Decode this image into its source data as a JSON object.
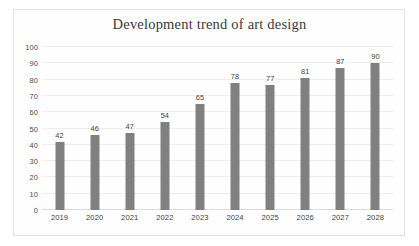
{
  "chart_data": {
    "type": "bar",
    "title": "Development trend of art design",
    "categories": [
      "2019",
      "2020",
      "2021",
      "2022",
      "2023",
      "2024",
      "2025",
      "2026",
      "2027",
      "2028"
    ],
    "values": [
      42,
      46,
      47,
      54,
      65,
      78,
      77,
      81,
      87,
      90
    ],
    "xlabel": "",
    "ylabel": "",
    "ylim": [
      0,
      100
    ],
    "y_ticks": [
      0,
      10,
      20,
      30,
      40,
      50,
      60,
      70,
      80,
      90,
      100
    ],
    "y_tick_labels": [
      "0",
      "10",
      "20",
      "30",
      "40",
      "50",
      "60",
      "70",
      "80",
      "90",
      "100"
    ],
    "grid": true,
    "legend": false,
    "data_labels": true,
    "series": [
      {
        "name": "Development trend of art design",
        "values": [
          42,
          46,
          47,
          54,
          65,
          78,
          77,
          81,
          87,
          90
        ]
      }
    ],
    "colors": {
      "bar": "#808080",
      "gridline": "#ededed",
      "baseline": "#dcdcdc",
      "frame_border": "#e3e3e3",
      "background": "#ffffff",
      "title_text": "#3a3a3a",
      "tick_text": "#3f3f3f"
    }
  }
}
